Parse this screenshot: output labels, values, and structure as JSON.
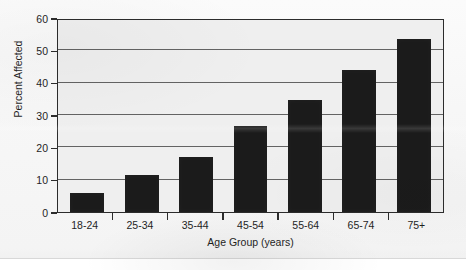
{
  "chart_data": {
    "type": "bar",
    "title": "",
    "categories": [
      "18-24",
      "25-34",
      "35-44",
      "45-54",
      "55-64",
      "65-74",
      "75+"
    ],
    "values": [
      5.8,
      11.5,
      17.0,
      26.5,
      34.5,
      44.0,
      53.5
    ],
    "xlabel": "Age Group (years)",
    "ylabel": "Percent Affected",
    "ylim": [
      0,
      60
    ],
    "yticks": [
      0,
      10,
      20,
      30,
      40,
      50,
      60
    ],
    "ytick_labels": [
      "0",
      "10",
      "20",
      "30",
      "40",
      "50",
      "60"
    ],
    "grid": true,
    "grid_axis": "y",
    "legend": false,
    "bar_color": "#1b1b1b",
    "plot_background": "#efefef",
    "frame_color": "#2c2c2c"
  },
  "figure": {
    "caption": ""
  }
}
